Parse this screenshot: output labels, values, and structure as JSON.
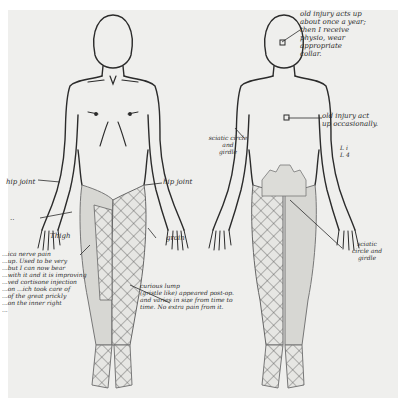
{
  "diagram": {
    "type": "body pain map",
    "views": [
      "front",
      "back"
    ],
    "colors": {
      "paper": "#efefed",
      "ink": "#2b2b2b",
      "shading": "#cfcfcb"
    }
  },
  "annotations": {
    "front": {
      "hip_joint_left": "hip joint",
      "hip_joint_right": "hip joint",
      "thigh": "Thigh",
      "groin": "groin",
      "left_dash": "..",
      "sciatic_note": "...ica nerve pain\n...up. Used to be very\n...but I can now bear\n...with it and it is improving\n...ved cortisone injection\n...on ...ich took care of\n...of the great prickly\n...on the inner right\n...",
      "curious_lump": "curious lump\n(gristle like) appeared post-op.\nand varies in size from time to\ntime. No extra pain from it."
    },
    "back": {
      "neck_injury": "old injury acts up\nabout once a year;\nthen I receive\nphysio, wear\nappropriate\ncollar.",
      "mid_back_injury": "old injury act\nup occasionally.",
      "vertebra_marks": "L i\nL 4",
      "sciatic_circle_left": "sciatic circle\nand\ngirdle",
      "sciatic_circle_right": "sciatic\ncircle and\ngirdle"
    }
  }
}
